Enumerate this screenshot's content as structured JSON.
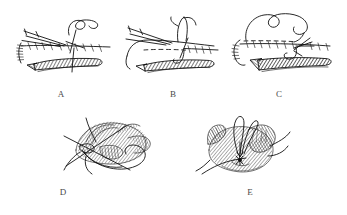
{
  "figure": {
    "background_color": "#ffffff",
    "ink_color": "#111111",
    "label_color": "#4a4a4a",
    "panel_count": 5,
    "panels": [
      {
        "id": "A",
        "label": "A",
        "row": 1,
        "column": 1,
        "content_description": "Line drawing: needle and suture thread passing through a tissue edge; running suture line with regular stitch ticks along a horizontal wound edge, cross-hatched shaded tissue flap below, several straight needle/instrument strokes entering from the left."
      },
      {
        "id": "B",
        "label": "B",
        "row": 1,
        "column": 2,
        "content_description": "Line drawing: tissue edge with a dashed interrupted suture line on the left half and a continuous ticked suture line on the right half; curved needle with thread loop rising above, cross-hatched shaded tissue band below."
      },
      {
        "id": "C",
        "label": "C",
        "row": 1,
        "column": 3,
        "content_description": "Line drawing: long looping suture thread curving above a horizontally running stitched wound line with dashed segment; bold cross-hatched shaded tissue wedge below, thread tail curving down at the left."
      },
      {
        "id": "D",
        "label": "D",
        "row": 2,
        "column": 1,
        "content_description": "Line drawing: rounded tissue mass with feathered/hatched shading, crossed by two straight instrument shafts forming an X at the left, and a large loop of suture thread encircling the lower portion."
      },
      {
        "id": "E",
        "label": "E",
        "row": 2,
        "column": 2,
        "content_description": "Line drawing: rounded closed tissue mass with hatched shading, two long thread loops rising from the top center, a small knotted star-like suture knot at the center, and thread tails trailing off to the lower left and the right."
      }
    ]
  }
}
